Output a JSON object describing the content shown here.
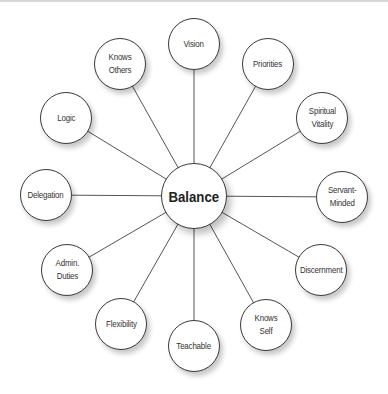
{
  "diagram": {
    "type": "hub-and-spoke",
    "center": {
      "label": "Balance",
      "x": 194,
      "y": 196,
      "r": 33
    },
    "nodes": [
      {
        "label": "Vision",
        "x": 194,
        "y": 44
      },
      {
        "label": "Priorities",
        "x": 268,
        "y": 64
      },
      {
        "label": "Spiritual\nVitality",
        "x": 322,
        "y": 118
      },
      {
        "label": "Servant-\nMinded",
        "x": 342,
        "y": 197
      },
      {
        "label": "Discernment",
        "x": 321,
        "y": 270
      },
      {
        "label": "Knows\nSelf",
        "x": 266,
        "y": 325
      },
      {
        "label": "Teachable",
        "x": 194,
        "y": 346
      },
      {
        "label": "Flexibility",
        "x": 121,
        "y": 324
      },
      {
        "label": "Admin.\nDuties",
        "x": 67,
        "y": 270
      },
      {
        "label": "Delegation",
        "x": 46,
        "y": 195
      },
      {
        "label": "Logic",
        "x": 66,
        "y": 118
      },
      {
        "label": "Knows\nOthers",
        "x": 120,
        "y": 64
      }
    ],
    "node_radius": 26,
    "colors": {
      "stroke": "#3a3a3a",
      "fill": "#ffffff",
      "text": "#333333",
      "link": "#555555"
    }
  }
}
